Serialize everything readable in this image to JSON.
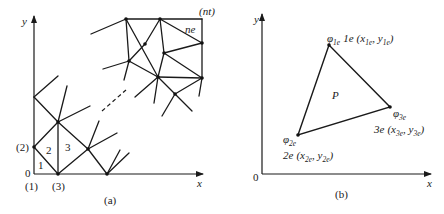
{
  "panel_a": {
    "caption": "(a)",
    "axis_x_label": "x",
    "axis_y_label": "y",
    "origin_label": "0",
    "node_labels": [
      "(1)",
      "(2)",
      "(3)",
      "(nt)"
    ],
    "element_labels": [
      "1",
      "2",
      "3",
      "ne"
    ]
  },
  "panel_b": {
    "caption": "(b)",
    "axis_x_label": "x",
    "axis_y_label": "y",
    "origin_label": "0",
    "interior_point_label": "P",
    "vertices": [
      {
        "phi": "φ",
        "phi_sub": "1e",
        "node": "1e",
        "coord_x": "x",
        "coord_x_sub": "1e",
        "coord_y": "y",
        "coord_y_sub": "1e"
      },
      {
        "phi": "φ",
        "phi_sub": "2e",
        "node": "2e",
        "coord_x": "x",
        "coord_x_sub": "2e",
        "coord_y": "y",
        "coord_y_sub": "2e"
      },
      {
        "phi": "φ",
        "phi_sub": "3e",
        "node": "3e",
        "coord_x": "x",
        "coord_x_sub": "3e",
        "coord_y": "y",
        "coord_y_sub": "3e"
      }
    ]
  }
}
